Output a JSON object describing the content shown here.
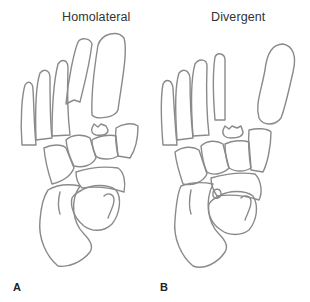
{
  "figure": {
    "panels": [
      {
        "id": "A",
        "title": "Homolateral",
        "label": "A"
      },
      {
        "id": "B",
        "title": "Divergent",
        "label": "B"
      }
    ],
    "style": {
      "stroke_color": "#8a8a8a",
      "background": "#ffffff",
      "text_color": "#333333"
    }
  }
}
